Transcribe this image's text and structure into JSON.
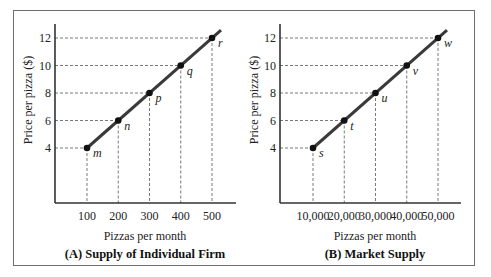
{
  "chart_data": [
    {
      "type": "line",
      "title": "(A) Supply of Individual Firm",
      "xlabel": "Pizzas per month",
      "ylabel": "Price per pizza ($)",
      "x": [
        100,
        200,
        300,
        400,
        500
      ],
      "x_tick_labels": [
        "100",
        "200",
        "300",
        "400",
        "500"
      ],
      "y_ticks": [
        4,
        6,
        8,
        10,
        12
      ],
      "y_tick_labels": [
        "4",
        "6",
        "8",
        "10",
        "12"
      ],
      "series": [
        {
          "name": "Supply",
          "values": [
            4,
            6,
            8,
            10,
            12
          ],
          "point_labels": [
            "m",
            "n",
            "p",
            "q",
            "r"
          ]
        }
      ],
      "grid": false,
      "dashed_guides": true,
      "color": "#3a3a3a"
    },
    {
      "type": "line",
      "title": "(B) Market Supply",
      "xlabel": "Pizzas per month",
      "ylabel": "Price per pizza ($)",
      "x": [
        10000,
        20000,
        30000,
        40000,
        50000
      ],
      "x_tick_labels": [
        "10,000",
        "20,000",
        "30,000",
        "40,000",
        "50,000"
      ],
      "y_ticks": [
        4,
        6,
        8,
        10,
        12
      ],
      "y_tick_labels": [
        "4",
        "6",
        "8",
        "10",
        "12"
      ],
      "series": [
        {
          "name": "Market Supply",
          "values": [
            4,
            6,
            8,
            10,
            12
          ],
          "point_labels": [
            "s",
            "t",
            "u",
            "v",
            "w"
          ]
        }
      ],
      "grid": false,
      "dashed_guides": true,
      "color": "#3a3a3a"
    }
  ]
}
